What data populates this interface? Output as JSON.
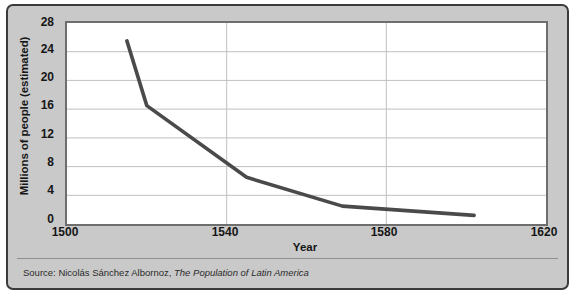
{
  "chart_data": {
    "type": "line",
    "title": "",
    "xlabel": "Year",
    "ylabel": "Millions of people (estimated)",
    "xlim": [
      1500,
      1620
    ],
    "ylim": [
      0,
      28
    ],
    "xticks": [
      1500,
      1540,
      1580,
      1620
    ],
    "yticks": [
      0,
      4,
      8,
      12,
      16,
      20,
      24,
      28
    ],
    "grid": "horizontal-and-vertical",
    "legend": "none",
    "series": [
      {
        "name": "Estimated population of Latin America",
        "color": "#4a4a4a",
        "x": [
          1515,
          1520,
          1545,
          1569,
          1602
        ],
        "values": [
          25.5,
          16.5,
          6.5,
          2.5,
          1.2
        ]
      }
    ]
  },
  "axes": {
    "y_tick_labels": [
      "28",
      "24",
      "20",
      "16",
      "12",
      "8",
      "4",
      "0"
    ],
    "x_tick_labels": [
      "1500",
      "1540",
      "1580",
      "1620"
    ],
    "x_title": "Year",
    "y_title": "Millions of people (estimated)"
  },
  "footer": {
    "source_prefix": "Source: Nicolás Sánchez Albornoz, ",
    "source_title": "The Population of Latin America"
  },
  "colors": {
    "panel_background": "#c9c9c9",
    "panel_border": "#3b3b3b",
    "plot_background": "#ffffff",
    "plot_border": "#6e6e6e",
    "gridline": "#c0c0c0",
    "line": "#4a4a4a",
    "text": "#161616"
  }
}
